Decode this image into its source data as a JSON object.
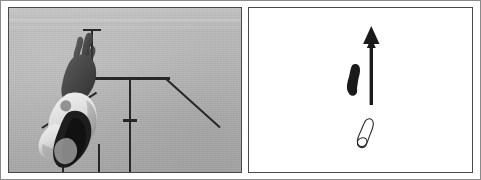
{
  "figure": {
    "caption": "",
    "panels": [
      {
        "id": "photograph",
        "name": "high-jump-photograph",
        "kind": "grayscale-photograph",
        "orientation": "inverted",
        "background_color": "#b9b9b9",
        "subject": "athlete clearing a crossbar, image shown upside down",
        "apparatus_elements": [
          "vertical-post-with-t-cap",
          "horizontal-crossbar",
          "center-vertical-post-with-tick",
          "diagonal-bar-right",
          "diagonal-bar-left",
          "bottom-leg-left",
          "bottom-leg-right"
        ]
      },
      {
        "id": "diagram",
        "name": "footprint-direction-diagram",
        "kind": "schematic-line-drawing",
        "background_color": "#ffffff",
        "elements": [
          {
            "name": "filled-footprint",
            "fill": "#1a1a1a",
            "style": "solid"
          },
          {
            "name": "outlined-footprint",
            "fill": "none",
            "stroke": "#2a2a2a",
            "style": "outline"
          },
          {
            "name": "direction-arrow",
            "color": "#1a1a1a",
            "points": "up"
          }
        ]
      }
    ],
    "frame": {
      "outer_border_color": "#8a8a8a",
      "panel_border_color": "#4a4a4a"
    }
  }
}
